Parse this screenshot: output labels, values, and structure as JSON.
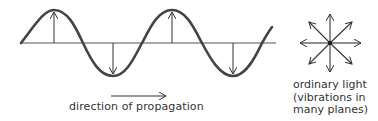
{
  "diagram": {
    "wave": {
      "description": "transverse wave with vertical vibration arrows",
      "axis_y": 43,
      "amplitude": 33,
      "color": "#444444"
    },
    "propagation": {
      "arrow_icon": "right-arrow-icon",
      "label": "direction of propagation"
    },
    "ordinary_light": {
      "icon": "multi-plane-vibration-star-icon",
      "lines": [
        "ordinary light",
        "(vibrations in",
        "many planes)"
      ]
    }
  }
}
